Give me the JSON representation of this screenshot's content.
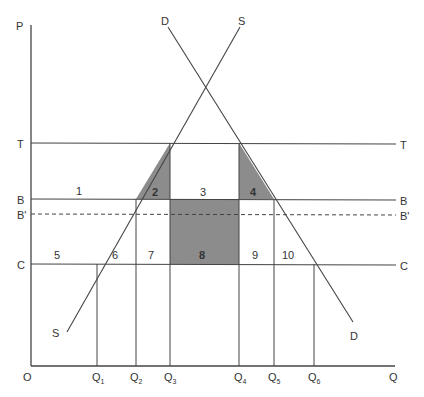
{
  "diagram": {
    "type": "supply-demand-price-band",
    "axes": {
      "y_label": "P",
      "x_label": "Q",
      "origin_label": "O"
    },
    "price_lines": [
      {
        "id": "T",
        "label_left": "T",
        "label_right": "T",
        "style": "solid"
      },
      {
        "id": "B",
        "label_left": "B",
        "label_right": "B",
        "style": "solid"
      },
      {
        "id": "Bp",
        "label_left": "B'",
        "label_right": "B'",
        "style": "dashed"
      },
      {
        "id": "C",
        "label_left": "C",
        "label_right": "C",
        "style": "solid"
      }
    ],
    "curves": {
      "supply": {
        "label_top": "S",
        "label_bottom": "S"
      },
      "demand": {
        "label_top": "D",
        "label_bottom": "D"
      }
    },
    "quantities": [
      {
        "base": "Q",
        "sub": "1"
      },
      {
        "base": "Q",
        "sub": "2"
      },
      {
        "base": "Q",
        "sub": "3"
      },
      {
        "base": "Q",
        "sub": "4"
      },
      {
        "base": "Q",
        "sub": "5"
      },
      {
        "base": "Q",
        "sub": "6"
      }
    ],
    "areas": {
      "a1": "1",
      "a2": "2",
      "a3": "3",
      "a4": "4",
      "a5": "5",
      "a6": "6",
      "a7": "7",
      "a8": "8",
      "a9": "9",
      "a10": "10"
    },
    "shaded_areas": [
      "2",
      "4",
      "8"
    ],
    "colors": {
      "line": "#444444",
      "shade": "#8c8c8c",
      "text": "#333333"
    }
  }
}
